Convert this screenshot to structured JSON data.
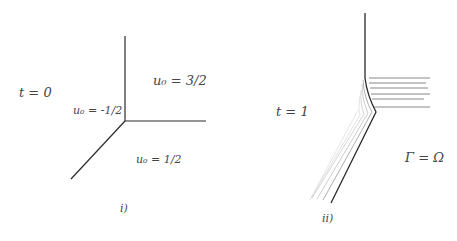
{
  "panel_i": {
    "caption": "i)",
    "time_label": "t = 0",
    "regions": [
      {
        "label": "u₀ = 3/2"
      },
      {
        "label": "u₀ = -1/2"
      },
      {
        "label": "u₀ = 1/2"
      }
    ]
  },
  "panel_ii": {
    "caption": "ii)",
    "time_label": "t = 1",
    "region_label": "Γ = Ω"
  },
  "colors": {
    "ink": "#2a2a2a",
    "faint": "#9a9a9a"
  }
}
